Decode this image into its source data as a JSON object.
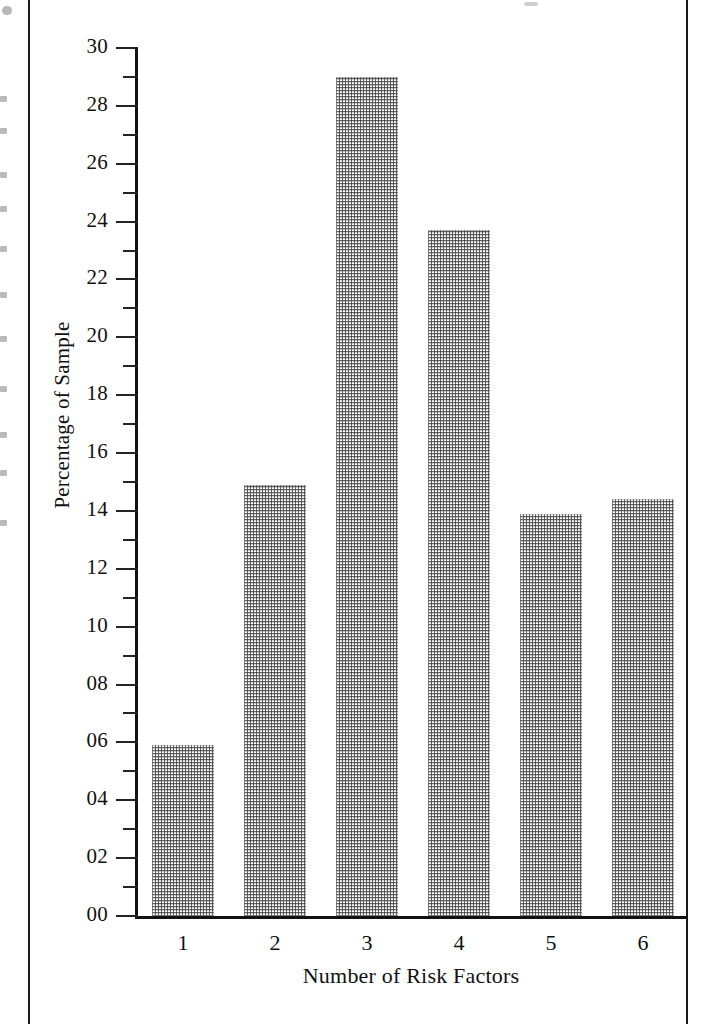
{
  "chart_data": {
    "type": "bar",
    "title": "",
    "xlabel": "Number of Risk Factors",
    "ylabel": "Percentage of Sample",
    "categories": [
      "1",
      "2",
      "3",
      "4",
      "5",
      "6"
    ],
    "values": [
      5.9,
      14.9,
      29.0,
      23.7,
      13.9,
      14.4
    ],
    "ylim": [
      0,
      30
    ],
    "ytick_labels": [
      "00",
      "02",
      "04",
      "06",
      "08",
      "10",
      "12",
      "14",
      "16",
      "18",
      "20",
      "22",
      "24",
      "26",
      "28",
      "30"
    ],
    "ytick_values": [
      0,
      2,
      4,
      6,
      8,
      10,
      12,
      14,
      16,
      18,
      20,
      22,
      24,
      26,
      28,
      30
    ],
    "yminor_values": [
      1,
      3,
      5,
      7,
      9,
      11,
      13,
      15,
      17,
      19,
      21,
      23,
      25,
      27,
      29
    ],
    "grid": false,
    "legend": null,
    "bar_fill": "halftone-dotted-gray",
    "axis_color": "#121212"
  },
  "figure": {
    "page_frame_color": "#1a1a1a",
    "background": "#ffffff"
  }
}
